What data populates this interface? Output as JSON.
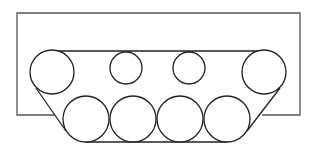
{
  "diagram": {
    "stroke_color": "#222222",
    "hull_color": "#555555",
    "background": "#ffffff",
    "hull": {
      "x1": 17,
      "y1": 13,
      "x2": 300,
      "y2": 115
    },
    "track_top_y": 51,
    "track_bottom_y": 142,
    "top_wheels": [
      {
        "cx": 52,
        "cy": 72,
        "r": 22
      },
      {
        "cx": 126,
        "cy": 68,
        "r": 16
      },
      {
        "cx": 189,
        "cy": 68,
        "r": 16
      },
      {
        "cx": 264,
        "cy": 72,
        "r": 22
      }
    ],
    "bottom_wheels": [
      {
        "cx": 86,
        "cy": 119,
        "r": 23
      },
      {
        "cx": 133,
        "cy": 119,
        "r": 23
      },
      {
        "cx": 180,
        "cy": 119,
        "r": 23
      },
      {
        "cx": 227,
        "cy": 119,
        "r": 23
      }
    ]
  }
}
